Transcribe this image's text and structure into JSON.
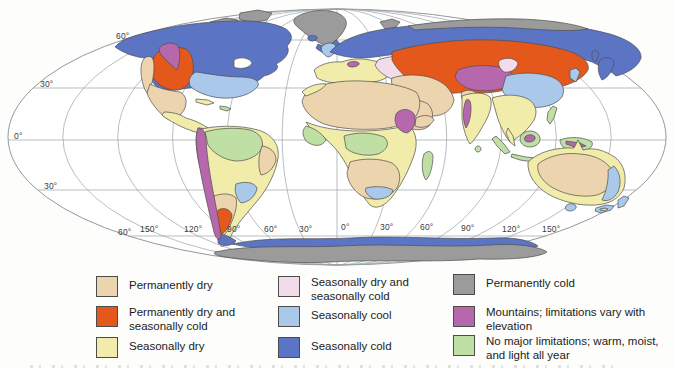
{
  "figure": {
    "type": "world-climate-limitations-map",
    "projection_outline_color": "#94999c",
    "graticule_color": "#9aa3a6",
    "region_outline_color": "#4d4d4d"
  },
  "zones": {
    "permanently_dry": {
      "label": "Permanently dry",
      "color": "#ecd5ae"
    },
    "permanently_dry_seasonally_cold": {
      "label": "Permanently dry and seasonally cold",
      "color": "#e5581c"
    },
    "seasonally_dry": {
      "label": "Seasonally dry",
      "color": "#f1eca9"
    },
    "seasonally_dry_seasonally_cold": {
      "label": "Seasonally dry and seasonally cold",
      "color": "#f2dce9"
    },
    "seasonally_cool": {
      "label": "Seasonally cool",
      "color": "#aac9ea"
    },
    "seasonally_cold": {
      "label": "Seasonally cold",
      "color": "#5b74c4"
    },
    "permanently_cold": {
      "label": "Permanently cold",
      "color": "#9b9b9b"
    },
    "mountains": {
      "label": "Mountains; limitations vary with elevation",
      "color": "#b767ab"
    },
    "no_major_limitations": {
      "label": "No major limitations; warm, moist, and light all year",
      "color": "#bfdfa5"
    }
  },
  "map": {
    "lat_labels": [
      {
        "text": "60°"
      },
      {
        "text": "30°"
      },
      {
        "text": "0°"
      },
      {
        "text": "30°"
      },
      {
        "text": "60°"
      }
    ],
    "lon_labels": [
      {
        "text": "150°"
      },
      {
        "text": "120°"
      },
      {
        "text": "90°"
      },
      {
        "text": "60°"
      },
      {
        "text": "30°"
      },
      {
        "text": "0°"
      },
      {
        "text": "30°"
      },
      {
        "text": "60°"
      },
      {
        "text": "90°"
      },
      {
        "text": "120°"
      },
      {
        "text": "150°"
      }
    ]
  }
}
